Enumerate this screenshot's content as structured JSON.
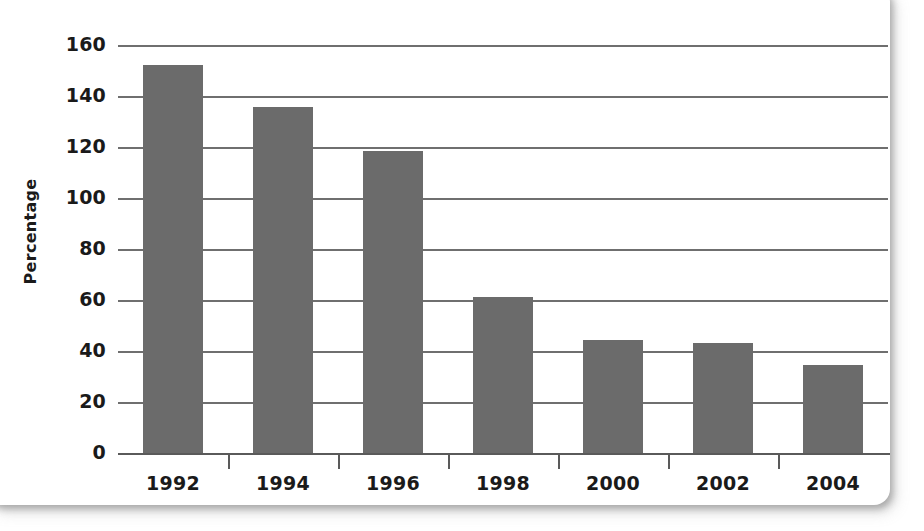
{
  "chart_data": {
    "type": "bar",
    "title": "",
    "xlabel": "",
    "ylabel": "Percentage",
    "categories": [
      "1992",
      "1994",
      "1996",
      "1998",
      "2000",
      "2002",
      "2004"
    ],
    "values": [
      152,
      135.5,
      118.5,
      61,
      44.5,
      43,
      34.5
    ],
    "ylim": [
      0,
      160
    ],
    "yticks": [
      0,
      20,
      40,
      60,
      80,
      100,
      120,
      140,
      160
    ],
    "ytick_labels": [
      "0",
      "20",
      "40",
      "60",
      "80",
      "100",
      "120",
      "140",
      "160"
    ],
    "grid": true,
    "legend": false,
    "bar_color": "#6b6b6b",
    "gridline_color": "#6f6f6f",
    "axis_color": "#5a5a5a",
    "background_color": "#ffffff"
  }
}
